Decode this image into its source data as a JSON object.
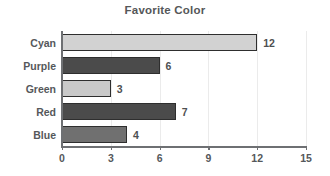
{
  "chart_data": {
    "type": "bar",
    "orientation": "horizontal",
    "title": "Favorite Color",
    "xlabel": "",
    "ylabel": "",
    "categories": [
      "Cyan",
      "Purple",
      "Green",
      "Red",
      "Blue"
    ],
    "values": [
      12,
      6,
      3,
      7,
      4
    ],
    "value_labels": [
      "12",
      "6",
      "3",
      "7",
      "4"
    ],
    "bar_colors": [
      "#d2d2d2",
      "#4b4b4b",
      "#c9c9c9",
      "#4b4b4b",
      "#707070"
    ],
    "bar_edge_color": "#2e2e2e",
    "xlim": [
      0,
      15
    ],
    "xticks": [
      0,
      3,
      6,
      9,
      12,
      15
    ],
    "xtick_labels": [
      "0",
      "3",
      "6",
      "9",
      "12",
      "15"
    ],
    "grid": true,
    "grid_axis": "x",
    "grid_color": "#ebebeb",
    "legend": false,
    "background": "#ffffff",
    "axis_color": "#6e7073",
    "text_color": "#55585b"
  }
}
